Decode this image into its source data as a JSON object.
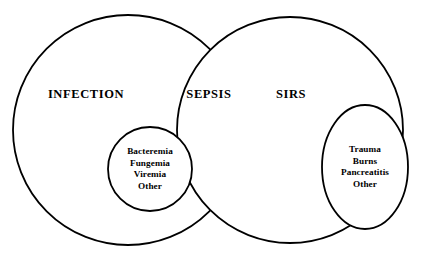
{
  "diagram": {
    "type": "venn",
    "title": "",
    "background_color": "#ffffff",
    "stroke_color": "#000000",
    "text_color": "#000000",
    "sets": [
      {
        "name": "infection-circle",
        "label": "INFECTION",
        "shape": "circle",
        "label_x": 86,
        "label_y": 95,
        "cx": 128,
        "cy": 130,
        "r": 115,
        "stroke_width": 1.8
      },
      {
        "name": "sirs-circle",
        "label": "SIRS",
        "shape": "circle",
        "label_x": 291,
        "label_y": 95,
        "cx": 290,
        "cy": 130,
        "r": 113,
        "stroke_width": 1.8
      }
    ],
    "intersection": {
      "name": "sepsis-region",
      "label": "SEPSIS",
      "label_x": 209,
      "label_y": 95
    },
    "subsets": [
      {
        "name": "bacteremia-circle",
        "shape": "circle",
        "cx": 150,
        "cy": 169,
        "r": 42,
        "stroke_width": 1.8,
        "items": [
          "Bacteremia",
          "Fungemia",
          "Viremia",
          "Other"
        ],
        "text_x": 150,
        "text_start_y": 152,
        "line_height": 11.5
      },
      {
        "name": "trauma-ellipse",
        "shape": "ellipse",
        "cx": 365,
        "cy": 167,
        "rx": 43,
        "ry": 62,
        "stroke_width": 1.8,
        "items": [
          "Trauma",
          "Burns",
          "Pancreatitis",
          "Other"
        ],
        "text_x": 365,
        "text_start_y": 150,
        "line_height": 11.5
      }
    ]
  }
}
